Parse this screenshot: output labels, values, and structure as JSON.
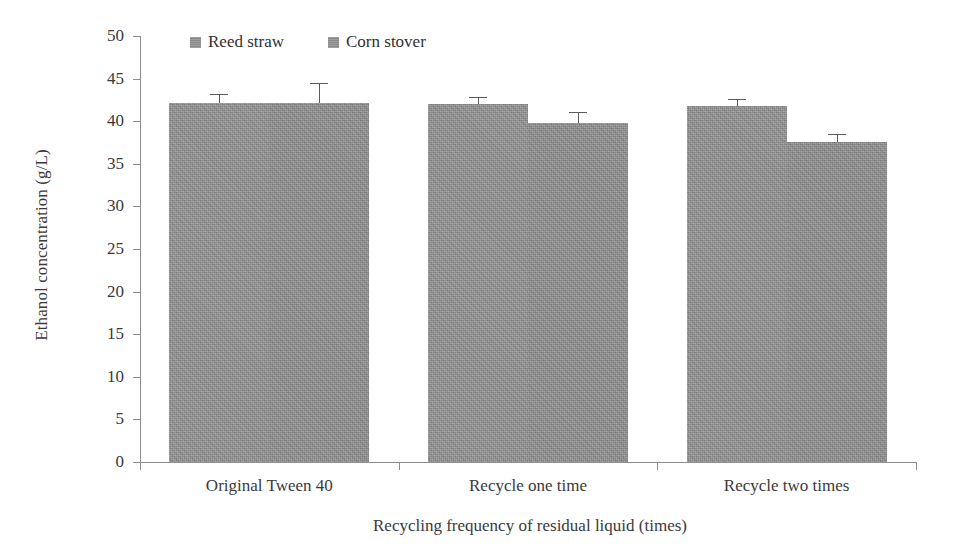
{
  "chart_data": {
    "type": "bar",
    "title": "",
    "xlabel": "Recycling frequency of residual liquid (times)",
    "ylabel": "Ethanol concentration (g/L)",
    "categories": [
      "Original Tween 40",
      "Recycle one time",
      "Recycle two times"
    ],
    "ylim": [
      0,
      50
    ],
    "yticks": [
      0,
      5,
      10,
      15,
      20,
      25,
      30,
      35,
      40,
      45,
      50
    ],
    "ytick_labels": [
      "0",
      "5",
      "10",
      "15",
      "20",
      "25",
      "30",
      "35",
      "40",
      "45",
      "50"
    ],
    "grid": false,
    "legend_position": "top-left",
    "bar_color": "#949494",
    "errorbar_color": "#5a5a5a",
    "axis_color": "#8d8d8d",
    "series": [
      {
        "name": "Reed straw",
        "color": "#949494",
        "values": [
          42.1,
          42.0,
          41.8
        ],
        "errors": [
          1.1,
          0.8,
          0.8
        ]
      },
      {
        "name": "Corn stover",
        "color": "#949494",
        "values": [
          42.1,
          39.8,
          37.6
        ],
        "errors": [
          2.4,
          1.3,
          0.9
        ]
      }
    ]
  }
}
